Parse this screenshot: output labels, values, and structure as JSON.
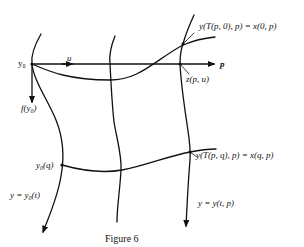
{
  "figure": {
    "caption": "Figure 6",
    "colors": {
      "ink": "#111111",
      "background": "#ffffff"
    },
    "labels": {
      "y0": "y",
      "y0_sub": "0",
      "u": "u",
      "p": "p",
      "f_y0_prefix": "f(y",
      "f_y0_sub": "0",
      "f_y0_suffix": ")",
      "top_right": "y(T(p, 0), p) = x(0, p)",
      "z_pu": "z(p, u)",
      "y0q_prefix": "y",
      "y0q_sub": "0",
      "y0q_suffix": "(q)",
      "mid_right": "y(T(p, q), p) = x(q, p)",
      "left_curve_prefix": "y = y",
      "left_curve_sub": "0",
      "left_curve_suffix": "(t)",
      "right_curve": "y = y(t, p)"
    }
  }
}
